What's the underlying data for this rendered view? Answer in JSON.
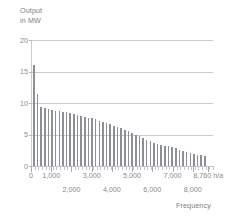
{
  "chart_data": {
    "type": "bar",
    "title": "",
    "ylabel_lines": [
      "Output",
      "in MW"
    ],
    "xlabel": "Frequency",
    "ylim": [
      0,
      20
    ],
    "yticks": [
      0,
      5,
      10,
      15,
      20
    ],
    "ytick_labels": [
      "0",
      "5",
      "10",
      "15",
      "20"
    ],
    "xlim": [
      0,
      9000
    ],
    "xunit": "h/a",
    "xticks": [
      0,
      1000,
      2000,
      3000,
      4000,
      5000,
      6000,
      7000,
      8000,
      8760
    ],
    "xtick_labels_row1": [
      {
        "value": 0,
        "label": "0"
      },
      {
        "value": 1000,
        "label": "1,000"
      },
      {
        "value": 3000,
        "label": "3,000"
      },
      {
        "value": 5000,
        "label": "5,000"
      },
      {
        "value": 7000,
        "label": "7,000"
      },
      {
        "value": 8760,
        "label": "8,760 h/a"
      }
    ],
    "xtick_labels_row2": [
      {
        "value": 2000,
        "label": "2,000"
      },
      {
        "value": 4000,
        "label": "4,000"
      },
      {
        "value": 6000,
        "label": "6,000"
      },
      {
        "value": 8000,
        "label": "8,000"
      }
    ],
    "grid": true,
    "legend": "none",
    "categories": [
      100,
      280,
      460,
      640,
      820,
      1000,
      1180,
      1360,
      1540,
      1720,
      1900,
      2080,
      2260,
      2440,
      2620,
      2800,
      2980,
      3160,
      3340,
      3520,
      3700,
      3880,
      4060,
      4240,
      4420,
      4600,
      4780,
      4960,
      5140,
      5320,
      5500,
      5680,
      5860,
      6040,
      6220,
      6400,
      6580,
      6760,
      6940,
      7120,
      7300,
      7480,
      7660,
      7840,
      8020,
      8200,
      8380,
      8560
    ],
    "values": [
      16.0,
      11.5,
      9.4,
      9.2,
      9.0,
      8.9,
      8.8,
      8.7,
      8.6,
      8.5,
      8.4,
      8.3,
      8.15,
      8.0,
      7.85,
      7.7,
      7.55,
      7.4,
      7.2,
      7.0,
      6.8,
      6.6,
      6.4,
      6.2,
      6.0,
      5.75,
      5.5,
      5.25,
      5.0,
      4.7,
      4.4,
      4.1,
      3.9,
      3.7,
      3.55,
      3.4,
      3.25,
      3.1,
      2.95,
      2.8,
      2.6,
      2.4,
      2.2,
      2.0,
      1.9,
      1.8,
      1.7,
      1.6
    ],
    "series_name": "Annual load duration curve",
    "colors": {
      "bar": "#8c9096",
      "grid": "#c9ccd1",
      "text": "#8a8a8a",
      "background": "#ffffff"
    }
  }
}
